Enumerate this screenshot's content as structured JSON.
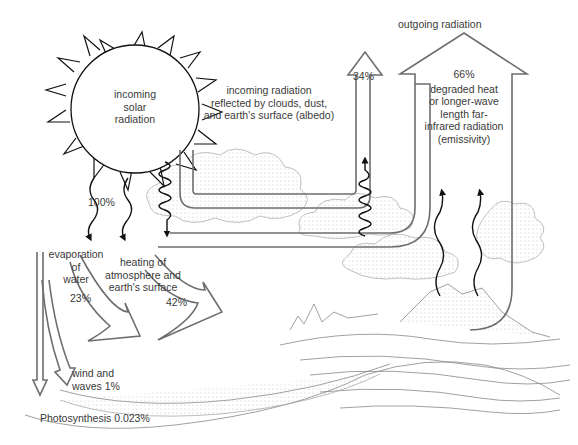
{
  "diagram": {
    "sun": {
      "label_lines": [
        "incoming",
        "solar",
        "radiation"
      ]
    },
    "incoming": {
      "percent": "100%"
    },
    "albedo": {
      "label_lines": [
        "incoming radiation",
        "reflected by clouds, dust,",
        "and earth's surface (albedo)"
      ],
      "percent": "34%"
    },
    "outgoing": {
      "label": "outgoing radiation"
    },
    "emissivity": {
      "percent": "66%",
      "label_lines": [
        "degraded heat",
        "or longer-wave",
        "length far-",
        "infrared radiation",
        "(emissivity)"
      ]
    },
    "evaporation": {
      "label_lines": [
        "evaporation",
        "of",
        "water"
      ],
      "percent": "23%"
    },
    "heating": {
      "label_lines": [
        "heating of",
        "atmosphere and",
        "earth's surface"
      ],
      "percent": "42%"
    },
    "wind": {
      "label_lines": [
        "wind and",
        "waves 1%"
      ]
    },
    "photosynthesis": {
      "label": "Photosynthesis 0.023%"
    },
    "colors": {
      "arrow_outline": "#6e6e6e",
      "wave": "#111111",
      "text": "#3a3a3a",
      "sketch": "#9a9a9a"
    }
  }
}
